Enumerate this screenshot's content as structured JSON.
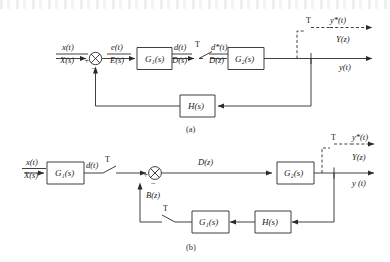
{
  "figure": {
    "captions": {
      "a": "(a)",
      "b": "(b)"
    }
  },
  "diagram_a": {
    "input": {
      "top": "x(t)",
      "bottom": "X(s)"
    },
    "summing_junction": {
      "plus": "+",
      "minus": "−"
    },
    "error": {
      "top": "e(t)",
      "bottom": "E(s)"
    },
    "block_g1": "G₁(s)",
    "pre_sampler": {
      "top": "d(t)",
      "bottom": "D(s)"
    },
    "sampler_label": "T",
    "post_sampler": {
      "top": "d*(t)",
      "bottom": "D(z)"
    },
    "block_g2": "G₂(s)",
    "output_sampler_label": "T",
    "output_starred": "y*(t)",
    "output_z": "Y(z)",
    "output_time": "y(t)",
    "feedback_block": "H(s)"
  },
  "diagram_b": {
    "input": {
      "top": "x(t)",
      "bottom": "X(s)"
    },
    "block_g1_forward": "G₁(s)",
    "pre_sampler": "d(t)",
    "sampler_label": "T",
    "summing_junction": {
      "plus": "+",
      "minus": "−"
    },
    "forward_signal": "D(z)",
    "block_g2": "G₂(s)",
    "output_sampler_label": "T",
    "output_starred": "y*(t)",
    "output_z": "Y(z)",
    "output_time": "y (t)",
    "feedback_signal": "B(z)",
    "feedback_sampler_label": "T",
    "feedback_block_g1": "G₁(s)",
    "feedback_block_h": "H(s)"
  },
  "colors": {
    "ink": "#2a2a2a",
    "paper": "#ffffff"
  }
}
